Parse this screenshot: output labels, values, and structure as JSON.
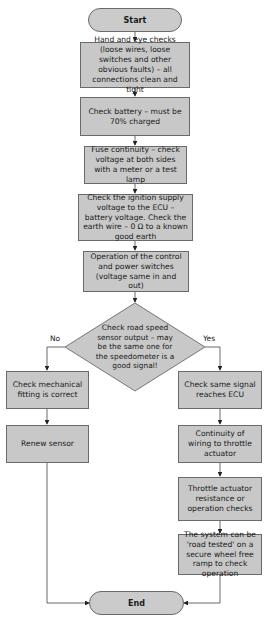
{
  "flowchart": {
    "start": "Start",
    "end": "End",
    "steps": [
      "Hand and eye checks (loose wires, loose switches and other obvious faults) – all connections clean and tight",
      "Check battery – must be 70% charged",
      "Fuse continuity – check voltage at both sides with a meter or a test lamp",
      "Check the ignition supply voltage to the ECU – battery voltage. Check the earth wire – 0 Ω to a known good earth",
      "Operation of the control and power switches (voltage same in and out)"
    ],
    "decision": "Check road speed sensor output – may be the same one for the speedometer is a good signal!",
    "no_label": "No",
    "yes_label": "Yes",
    "no_branch": [
      "Check mechanical fitting is correct",
      "Renew sensor"
    ],
    "yes_branch": [
      "Check same signal reaches ECU",
      "Continuity of wiring to throttle actuator",
      "Throttle actuator resistance or operation checks",
      "The system can be 'road tested' on a secure wheel free ramp to check operation"
    ]
  }
}
